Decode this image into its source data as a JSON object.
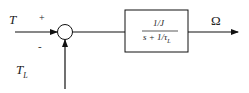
{
  "diagram": {
    "type": "block-diagram",
    "inputs": {
      "torque": "T",
      "torque_sign": "+",
      "load_torque_main": "T",
      "load_torque_sub": "L",
      "load_sign": "-"
    },
    "block": {
      "numerator": "1/J",
      "denominator_prefix": "s + 1/τ",
      "denominator_sub": "L"
    },
    "output": {
      "label": "Ω"
    },
    "colors": {
      "line": "#111111",
      "box_fill": "#ffffff"
    }
  }
}
